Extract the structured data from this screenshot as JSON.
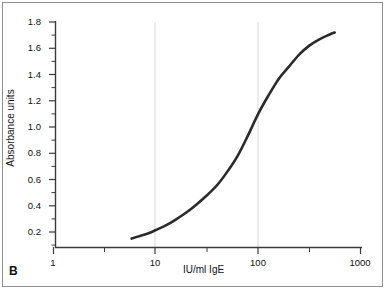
{
  "figure": {
    "panel_label": "B",
    "border_color": "#8f8f8f",
    "background": "#ffffff"
  },
  "chart_data": {
    "type": "line",
    "title": "",
    "subtitle": "",
    "xlabel": "IU/ml IgE",
    "ylabel": "Absorbance units",
    "xscale": "log",
    "yscale": "linear",
    "xlim": [
      1,
      1000
    ],
    "ylim": [
      0.085,
      1.82
    ],
    "grid": "vertical-decade-gridlines-only",
    "grid_color": "#d8d8d8",
    "legend": "none",
    "line_color": "#2b2b2b",
    "line_width_px": 2.6,
    "xticks": [
      1,
      10,
      100,
      1000
    ],
    "xtick_labels": [
      "1",
      "10",
      "100",
      "1000"
    ],
    "xminor_ticks": [
      3.16,
      31.6,
      316
    ],
    "yticks": [
      0.2,
      0.4,
      0.6,
      0.8,
      1.0,
      1.2,
      1.4,
      1.6,
      1.8
    ],
    "ytick_labels": [
      "0.2",
      "0.4",
      "0.6",
      "0.8",
      "1.0",
      "1.2",
      "1.4",
      "1.6",
      "1.8"
    ],
    "yminor_ticks": [
      0.1,
      0.3,
      0.5,
      0.7,
      0.9,
      1.1,
      1.3,
      1.5,
      1.7
    ],
    "series": [
      {
        "name": "standard curve",
        "x": [
          5.8,
          7.0,
          8.5,
          10.0,
          12.5,
          15.0,
          20.0,
          25.0,
          31.6,
          40.0,
          50.0,
          63.0,
          80.0,
          100.0,
          126.0,
          160.0,
          200.0,
          250.0,
          316.0,
          400.0,
          500.0,
          560.0
        ],
        "y": [
          0.15,
          0.17,
          0.19,
          0.215,
          0.25,
          0.285,
          0.35,
          0.41,
          0.48,
          0.56,
          0.66,
          0.78,
          0.94,
          1.1,
          1.24,
          1.37,
          1.46,
          1.55,
          1.62,
          1.67,
          1.705,
          1.72
        ]
      }
    ]
  }
}
